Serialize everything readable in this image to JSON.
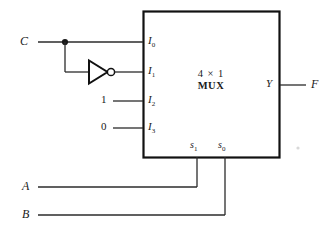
{
  "diagram": {
    "line_color": "#2b2b2b",
    "box_color": "#111111",
    "background": "#ffffff",
    "chip": {
      "label_line1": "4 × 1",
      "label_line2": "MUX",
      "data_inputs": [
        {
          "name": "I0",
          "base": "I",
          "sub": "0",
          "source": "C"
        },
        {
          "name": "I1",
          "base": "I",
          "sub": "1",
          "source": "C-inverted"
        },
        {
          "name": "I2",
          "base": "I",
          "sub": "2",
          "source": "1"
        },
        {
          "name": "I3",
          "base": "I",
          "sub": "3",
          "source": "0"
        }
      ],
      "select_inputs": [
        {
          "name": "s1",
          "base": "s",
          "sub": "1",
          "source": "A"
        },
        {
          "name": "s0",
          "base": "s",
          "sub": "0",
          "source": "B"
        }
      ],
      "output": {
        "name": "Y",
        "base": "Y"
      }
    },
    "signals": {
      "c_input": "C",
      "const_one": "1",
      "const_zero": "0",
      "a_input": "A",
      "b_input": "B",
      "f_output": "F"
    },
    "inverter": {
      "type": "NOT-gate",
      "bubble": true
    }
  }
}
